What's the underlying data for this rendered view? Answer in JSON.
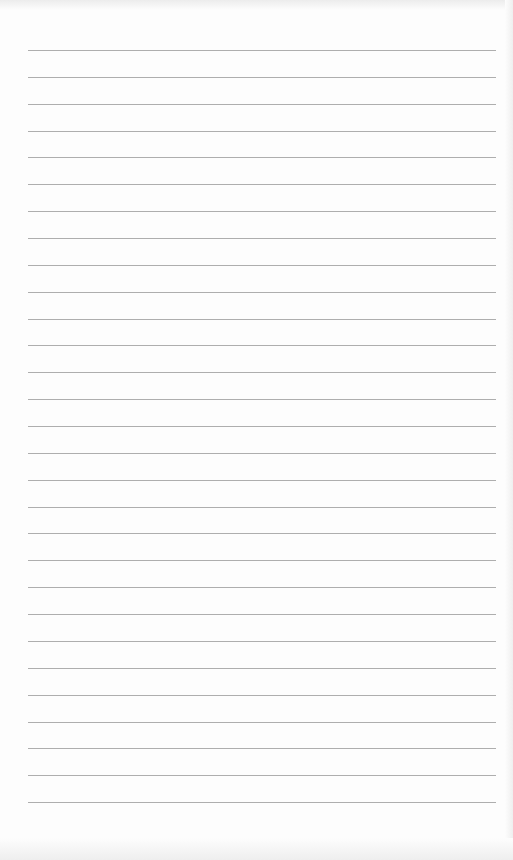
{
  "page": {
    "type": "lined-paper",
    "line_count": 29,
    "first_line_y": 50,
    "line_spacing": 26.86,
    "line_color": "#9a9a9a",
    "paper_color": "#fdfdfd"
  }
}
